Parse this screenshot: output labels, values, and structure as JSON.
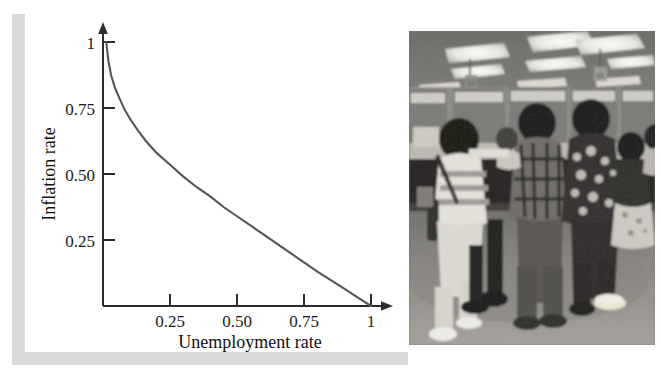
{
  "figure": {
    "panels": [
      {
        "name": "phillips-curve-chart",
        "kind": "line-chart"
      },
      {
        "name": "unemployment-office-photograph",
        "kind": "photograph"
      }
    ]
  },
  "chart_data": {
    "type": "line",
    "title": "",
    "xlabel": "Unemployment rate",
    "ylabel": "Inflation rate",
    "xlim": [
      0,
      1.08
    ],
    "ylim": [
      0,
      1.12
    ],
    "grid": false,
    "legend": null,
    "xticks": [
      0.25,
      0.5,
      0.75,
      1
    ],
    "xticklabels": [
      "0.25",
      "0.50",
      "0.75",
      "1"
    ],
    "yticks": [
      0.25,
      0.5,
      0.75,
      1
    ],
    "yticklabels": [
      "0.25",
      "0.50",
      "0.75",
      "1"
    ],
    "axis_arrows": {
      "x": "right",
      "y": "up"
    },
    "series": [
      {
        "name": "Phillips curve",
        "color": "#555555",
        "x": [
          0.012,
          0.02,
          0.03,
          0.045,
          0.06,
          0.08,
          0.1,
          0.13,
          0.16,
          0.2,
          0.25,
          0.3,
          0.35,
          0.4,
          0.45,
          0.5,
          0.55,
          0.6,
          0.65,
          0.7,
          0.75,
          0.8,
          0.85,
          0.9,
          0.95,
          1.0
        ],
        "y": [
          1.0,
          0.93,
          0.875,
          0.825,
          0.79,
          0.745,
          0.71,
          0.665,
          0.625,
          0.58,
          0.535,
          0.49,
          0.45,
          0.415,
          0.375,
          0.34,
          0.305,
          0.27,
          0.235,
          0.2,
          0.165,
          0.13,
          0.098,
          0.066,
          0.033,
          0.0
        ]
      }
    ]
  },
  "photo": {
    "caption": "",
    "alt_name": "unemployment-office-queue-photo",
    "palette": {
      "floor": "#8d8a85",
      "counter_dark": "#23211f",
      "ceiling": "#7a7975",
      "light_panel": "#f2f1ec"
    },
    "signs": [
      "12",
      "11"
    ]
  },
  "colors": {
    "page_background": "#ffffff",
    "panel_background": "#ffffff",
    "shadow_band": "#d9d9d9",
    "axis": "#2c2c2c",
    "curve": "#555555",
    "text": "#111111"
  }
}
